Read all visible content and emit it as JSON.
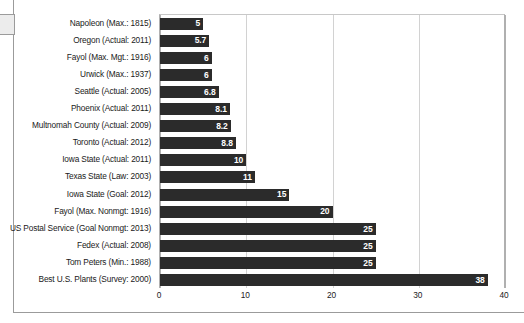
{
  "chart_data": {
    "type": "bar",
    "orientation": "horizontal",
    "title": "",
    "subtitle": "",
    "xlabel": "",
    "ylabel": "",
    "xlim": [
      0,
      40
    ],
    "grid": true,
    "gridlines": [
      0,
      10,
      20,
      30,
      40
    ],
    "legend": "none",
    "bar_color": "#2b2b2b",
    "value_label_color": "#ffffff",
    "gridline_color": "#d2d2d2",
    "xticks": [
      "0",
      "10",
      "20",
      "30",
      "40"
    ],
    "categories": [
      "Napoleon (Max.: 1815)",
      "Oregon (Actual: 2011)",
      "Fayol (Max. Mgt.: 1916)",
      "Urwick (Max.: 1937)",
      "Seattle (Actual: 2005)",
      "Phoenix (Actual: 2011)",
      "Multnomah County (Actual: 2009)",
      "Toronto (Actual: 2012)",
      "Iowa State (Actual: 2011)",
      "Texas State (Law: 2003)",
      "Iowa State (Goal: 2012)",
      "Fayol (Max. Nonmgt: 1916)",
      "US Postal Service (Goal Nonmgt: 2013)",
      "Fedex (Actual: 2008)",
      "Tom Peters (Min.: 1988)",
      "Best U.S. Plants (Survey: 2000)"
    ],
    "values": [
      5,
      5.7,
      6,
      6,
      6.8,
      8.1,
      8.2,
      8.8,
      10,
      11,
      15,
      20,
      25,
      25,
      25,
      38
    ],
    "value_labels": [
      "5",
      "5.7",
      "6",
      "6",
      "6.8",
      "8.1",
      "8.2",
      "8.8",
      "10",
      "11",
      "15",
      "20",
      "25",
      "25",
      "25",
      "38"
    ]
  }
}
